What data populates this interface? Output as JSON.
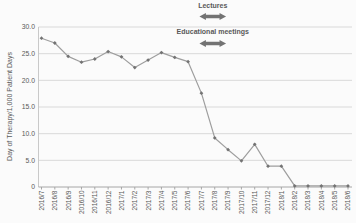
{
  "chart_data": {
    "type": "line",
    "title": "",
    "xlabel": "",
    "ylabel": "Day of Therapy/1,000 Patient Days",
    "ylim": [
      0,
      30
    ],
    "ytick_values": [
      0,
      5,
      10,
      15,
      20,
      25,
      30
    ],
    "ytick_labels": [
      "0",
      "5.0",
      "10.0",
      "15.0",
      "20.0",
      "25.0",
      "30.0"
    ],
    "grid": "horizontal",
    "legend": "none",
    "categories": [
      "2016/7",
      "2016/8",
      "2016/9",
      "2016/10",
      "2016/11",
      "2016/12",
      "2017/1",
      "2017/2",
      "2017/3",
      "2017/4",
      "2017/5",
      "2017/6",
      "2017/7",
      "2017/8",
      "2017/9",
      "2017/10",
      "2017/11",
      "2017/12",
      "2018/1",
      "2018/2",
      "2018/3",
      "2018/4",
      "2018/5",
      "2018/6"
    ],
    "values": [
      27.9,
      27.0,
      24.5,
      23.4,
      24.0,
      25.4,
      24.4,
      22.4,
      23.8,
      25.2,
      24.3,
      23.5,
      17.6,
      9.2,
      7.0,
      4.9,
      8.0,
      3.9,
      3.9,
      0.2,
      0.2,
      0.2,
      0.2,
      0.2
    ],
    "marker_shape": "diamond",
    "annotations": [
      {
        "label": "Lectures",
        "arrow": "double-headed-horizontal",
        "span_categories": [
          "2017/7",
          "2017/9"
        ]
      },
      {
        "label": "Educational meetings",
        "arrow": "double-headed-horizontal",
        "span_categories": [
          "2017/7",
          "2017/9"
        ]
      }
    ],
    "colors": {
      "series": "#9e9e9e",
      "marker": "#737373",
      "grid": "#d9d9d9",
      "axis": "#a6a6a6",
      "axis_light": "#c9c9c9",
      "text": "#595959",
      "arrow": "#737373",
      "background": "#fbfbfb"
    }
  }
}
